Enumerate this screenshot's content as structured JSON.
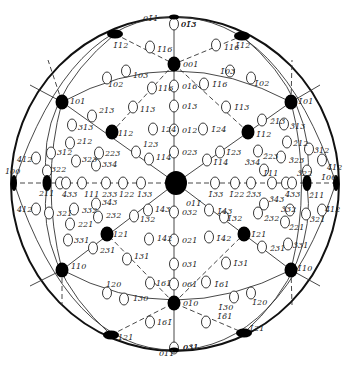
{
  "diagram": {
    "title": "",
    "type": "stereographic-projection",
    "center_pole": "011",
    "colors": {
      "ink": "#111111",
      "background": "#ffffff"
    },
    "major_poles": [
      {
        "label": "001",
        "x": 174,
        "y": 64
      },
      {
        "label": "010",
        "x": 174,
        "y": 303
      },
      {
        "label": "101",
        "x": 62,
        "y": 102
      },
      {
        "label": "1̄01",
        "x": 291,
        "y": 102
      },
      {
        "label": "110",
        "x": 62,
        "y": 270
      },
      {
        "label": "1̄10",
        "x": 291,
        "y": 270
      },
      {
        "label": "100",
        "x": 14,
        "y": 183
      },
      {
        "label": "1̄00",
        "x": 336,
        "y": 183
      },
      {
        "label": "211",
        "x": 47,
        "y": 183
      },
      {
        "label": "2̄11",
        "x": 307,
        "y": 183
      },
      {
        "label": "112",
        "x": 112,
        "y": 132
      },
      {
        "label": "1̄12",
        "x": 248,
        "y": 132
      },
      {
        "label": "121",
        "x": 107,
        "y": 234
      },
      {
        "label": "1̄21",
        "x": 244,
        "y": 234
      },
      {
        "label": "1̄12 (top)",
        "x": 242,
        "y": 36
      },
      {
        "label": "112 (top)",
        "x": 115,
        "y": 34
      },
      {
        "label": "121 (bottom)",
        "x": 111,
        "y": 335
      },
      {
        "label": "1̄21 (bottom)",
        "x": 244,
        "y": 333
      },
      {
        "label": "011",
        "x": 176,
        "y": 183
      },
      {
        "label": "011 (top)",
        "x": 174,
        "y": 17
      },
      {
        "label": "011 (bottom)",
        "x": 174,
        "y": 350
      }
    ],
    "minor_poles": [
      {
        "label": "01̄3",
        "x": 174,
        "y": 24,
        "tx": 181,
        "ty": 27
      },
      {
        "label": "1̄16",
        "x": 150,
        "y": 47,
        "tx": 157,
        "ty": 52
      },
      {
        "label": "116",
        "x": 216,
        "y": 45,
        "tx": 224,
        "ty": 50
      },
      {
        "label": "103",
        "x": 126,
        "y": 71,
        "tx": 133,
        "ty": 78
      },
      {
        "label": "102",
        "x": 107,
        "y": 78,
        "tx": 108,
        "ty": 87
      },
      {
        "label": "1̄03",
        "x": 230,
        "y": 71,
        "tx": 220,
        "ty": 74
      },
      {
        "label": "1̄02",
        "x": 251,
        "y": 78,
        "tx": 254,
        "ty": 86
      },
      {
        "label": "116",
        "x": 152,
        "y": 88,
        "tx": 158,
        "ty": 91
      },
      {
        "label": "1̄16",
        "x": 204,
        "y": 84,
        "tx": 212,
        "ty": 87
      },
      {
        "label": "016",
        "x": 174,
        "y": 86,
        "tx": 182,
        "ty": 89
      },
      {
        "label": "013",
        "x": 174,
        "y": 106,
        "tx": 182,
        "ty": 109
      },
      {
        "label": "113",
        "x": 133,
        "y": 107,
        "tx": 140,
        "ty": 112
      },
      {
        "label": "1̄13",
        "x": 226,
        "y": 107,
        "tx": 234,
        "ty": 110
      },
      {
        "label": "213",
        "x": 92,
        "y": 116,
        "tx": 99,
        "ty": 113
      },
      {
        "label": "2̄13",
        "x": 262,
        "y": 120,
        "tx": 270,
        "ty": 124
      },
      {
        "label": "313",
        "x": 72,
        "y": 125,
        "tx": 78,
        "ty": 130
      },
      {
        "label": "3̄13",
        "x": 284,
        "y": 124,
        "tx": 290,
        "ty": 129
      },
      {
        "label": "312",
        "x": 51,
        "y": 153,
        "tx": 57,
        "ty": 155
      },
      {
        "label": "3̄12",
        "x": 309,
        "y": 149,
        "tx": 314,
        "ty": 153
      },
      {
        "label": "212",
        "x": 70,
        "y": 143,
        "tx": 77,
        "ty": 144
      },
      {
        "label": "2̄12",
        "x": 287,
        "y": 142,
        "tx": 293,
        "ty": 146
      },
      {
        "label": "412",
        "x": 36,
        "y": 158,
        "tx": 17,
        "ty": 162
      },
      {
        "label": "4̄12",
        "x": 322,
        "y": 160,
        "tx": 327,
        "ty": 170
      },
      {
        "label": "323",
        "x": 76,
        "y": 161,
        "tx": 82,
        "ty": 162
      },
      {
        "label": "3̄23",
        "x": 281,
        "y": 157,
        "tx": 289,
        "ty": 163
      },
      {
        "label": "223",
        "x": 99,
        "y": 153,
        "tx": 105,
        "ty": 156
      },
      {
        "label": "2̄23",
        "x": 258,
        "y": 151,
        "tx": 263,
        "ty": 159
      },
      {
        "label": "334",
        "x": 96,
        "y": 165,
        "tx": 102,
        "ty": 167
      },
      {
        "label": "3̄34",
        "x": 264,
        "y": 170,
        "tx": 245,
        "ty": 165
      },
      {
        "label": "124",
        "x": 153,
        "y": 129,
        "tx": 161,
        "ty": 132
      },
      {
        "label": "1̄24",
        "x": 203,
        "y": 129,
        "tx": 211,
        "ty": 132
      },
      {
        "label": "012",
        "x": 174,
        "y": 130,
        "tx": 182,
        "ty": 133
      },
      {
        "label": "023",
        "x": 174,
        "y": 152,
        "tx": 182,
        "ty": 155
      },
      {
        "label": "123",
        "x": 136,
        "y": 152,
        "tx": 143,
        "ty": 147
      },
      {
        "label": "114",
        "x": 149,
        "y": 159,
        "tx": 156,
        "ty": 160
      },
      {
        "label": "1̄23",
        "x": 220,
        "y": 152,
        "tx": 226,
        "ty": 155
      },
      {
        "label": "1̄14",
        "x": 207,
        "y": 160,
        "tx": 213,
        "ty": 165
      },
      {
        "label": "322",
        "x": 47,
        "y": 171,
        "tx": 51,
        "ty": 172
      },
      {
        "label": "3̄22",
        "x": 307,
        "y": 171,
        "tx": 297,
        "ty": 176
      },
      {
        "label": "433a",
        "x": 60,
        "y": 183,
        "tx": 62,
        "ty": 197
      },
      {
        "label": "433",
        "x": 66,
        "y": 183,
        "tx": 62,
        "ty": 197
      },
      {
        "label": "111",
        "x": 82,
        "y": 183,
        "tx": 84,
        "ty": 197
      },
      {
        "label": "233",
        "x": 106,
        "y": 183,
        "tx": 102,
        "ty": 197
      },
      {
        "label": "122",
        "x": 123,
        "y": 183,
        "tx": 119,
        "ty": 197
      },
      {
        "label": "133",
        "x": 141,
        "y": 183,
        "tx": 137,
        "ty": 197
      },
      {
        "label": "1̄33",
        "x": 215,
        "y": 183,
        "tx": 208,
        "ty": 197
      },
      {
        "label": "1̄22",
        "x": 235,
        "y": 183,
        "tx": 229,
        "ty": 197
      },
      {
        "label": "2̄33",
        "x": 251,
        "y": 183,
        "tx": 246,
        "ty": 197
      },
      {
        "label": "1̄11",
        "x": 272,
        "y": 183,
        "tx": 263,
        "ty": 176
      },
      {
        "label": "4̄33a",
        "x": 286,
        "y": 183,
        "tx": 285,
        "ty": 197
      },
      {
        "label": "4̄33",
        "x": 292,
        "y": 183,
        "tx": 285,
        "ty": 197
      },
      {
        "label": "412",
        "x": 36,
        "y": 209,
        "tx": 17,
        "ty": 212
      },
      {
        "label": "4̄12",
        "x": 322,
        "y": 210,
        "tx": 325,
        "ty": 212
      },
      {
        "label": "321",
        "x": 49,
        "y": 213,
        "tx": 57,
        "ty": 216
      },
      {
        "label": "3̄21",
        "x": 306,
        "y": 214,
        "tx": 310,
        "ty": 222
      },
      {
        "label": "343",
        "x": 96,
        "y": 204,
        "tx": 102,
        "ty": 205
      },
      {
        "label": "3̄43",
        "x": 264,
        "y": 204,
        "tx": 269,
        "ty": 202
      },
      {
        "label": "332",
        "x": 74,
        "y": 209,
        "tx": 82,
        "ty": 213
      },
      {
        "label": "3̄32",
        "x": 290,
        "y": 210,
        "tx": 281,
        "ty": 212
      },
      {
        "label": "232",
        "x": 98,
        "y": 217,
        "tx": 106,
        "ty": 218
      },
      {
        "label": "2̄32",
        "x": 258,
        "y": 213,
        "tx": 264,
        "ty": 221
      },
      {
        "label": "221",
        "x": 70,
        "y": 224,
        "tx": 78,
        "ty": 227
      },
      {
        "label": "2̄21",
        "x": 285,
        "y": 222,
        "tx": 289,
        "ty": 230
      },
      {
        "label": "143",
        "x": 148,
        "y": 210,
        "tx": 155,
        "ty": 212
      },
      {
        "label": "1̄43",
        "x": 209,
        "y": 210,
        "tx": 217,
        "ty": 214
      },
      {
        "label": "132",
        "x": 134,
        "y": 216,
        "tx": 140,
        "ty": 222
      },
      {
        "label": "1̄32",
        "x": 224,
        "y": 217,
        "tx": 227,
        "ty": 221
      },
      {
        "label": "011̄",
        "x": 176,
        "y": 183,
        "tx": 186,
        "ty": 206
      },
      {
        "label": "032",
        "x": 174,
        "y": 212,
        "tx": 182,
        "ty": 215
      },
      {
        "label": "021",
        "x": 174,
        "y": 240,
        "tx": 182,
        "ty": 243
      },
      {
        "label": "142",
        "x": 149,
        "y": 239,
        "tx": 157,
        "ty": 241
      },
      {
        "label": "1̄42",
        "x": 209,
        "y": 237,
        "tx": 216,
        "ty": 241
      },
      {
        "label": "331",
        "x": 68,
        "y": 240,
        "tx": 74,
        "ty": 243
      },
      {
        "label": "3̄31",
        "x": 288,
        "y": 244,
        "tx": 293,
        "ty": 248
      },
      {
        "label": "231",
        "x": 93,
        "y": 248,
        "tx": 100,
        "ty": 253
      },
      {
        "label": "2̄31",
        "x": 262,
        "y": 247,
        "tx": 270,
        "ty": 251
      },
      {
        "label": "131",
        "x": 127,
        "y": 259,
        "tx": 134,
        "ty": 259
      },
      {
        "label": "1̄31",
        "x": 226,
        "y": 263,
        "tx": 233,
        "ty": 266
      },
      {
        "label": "031",
        "x": 174,
        "y": 264,
        "tx": 182,
        "ty": 267
      },
      {
        "label": "061",
        "x": 174,
        "y": 284,
        "tx": 182,
        "ty": 287
      },
      {
        "label": "161",
        "x": 150,
        "y": 283,
        "tx": 156,
        "ty": 286
      },
      {
        "label": "1̄61",
        "x": 206,
        "y": 282,
        "tx": 214,
        "ty": 287
      },
      {
        "label": "120",
        "x": 107,
        "y": 293,
        "tx": 106,
        "ty": 287
      },
      {
        "label": "130",
        "x": 124,
        "y": 299,
        "tx": 133,
        "ty": 301
      },
      {
        "label": "1̄30",
        "x": 234,
        "y": 297,
        "tx": 218,
        "ty": 310
      },
      {
        "label": "1̄20",
        "x": 251,
        "y": 293,
        "tx": 252,
        "ty": 305
      },
      {
        "label": "161̄",
        "x": 150,
        "y": 322,
        "tx": 157,
        "ty": 325
      },
      {
        "label": "1̄6̄1",
        "x": 206,
        "y": 322,
        "tx": 217,
        "ty": 319
      },
      {
        "label": "03̄1",
        "x": 174,
        "y": 348,
        "tx": 183,
        "ty": 350
      }
    ],
    "edge_labels": [
      {
        "text": "01̄1",
        "x": 143,
        "y": 21
      },
      {
        "text": "01̄3",
        "x": 181,
        "y": 27
      },
      {
        "text": "1̄12",
        "x": 235,
        "y": 48
      },
      {
        "text": "1̄12",
        "x": 113,
        "y": 48
      },
      {
        "text": "001",
        "x": 183,
        "y": 67
      },
      {
        "text": "1̄01",
        "x": 298,
        "y": 104
      },
      {
        "text": "101",
        "x": 70,
        "y": 104
      },
      {
        "text": "112",
        "x": 118,
        "y": 136
      },
      {
        "text": "1̄12",
        "x": 256,
        "y": 137
      },
      {
        "text": "100",
        "x": 5,
        "y": 174
      },
      {
        "text": "1̄00",
        "x": 321,
        "y": 180
      },
      {
        "text": "211",
        "x": 39,
        "y": 196
      },
      {
        "text": "2̄11",
        "x": 309,
        "y": 198
      },
      {
        "text": "121",
        "x": 113,
        "y": 237
      },
      {
        "text": "1̄21",
        "x": 251,
        "y": 237
      },
      {
        "text": "110",
        "x": 71,
        "y": 269
      },
      {
        "text": "1̄10",
        "x": 297,
        "y": 271
      },
      {
        "text": "010",
        "x": 183,
        "y": 306
      },
      {
        "text": "121",
        "x": 118,
        "y": 340
      },
      {
        "text": "1̄21",
        "x": 249,
        "y": 331
      },
      {
        "text": "011",
        "x": 159,
        "y": 356
      },
      {
        "text": "031",
        "x": 183,
        "y": 350
      }
    ]
  }
}
